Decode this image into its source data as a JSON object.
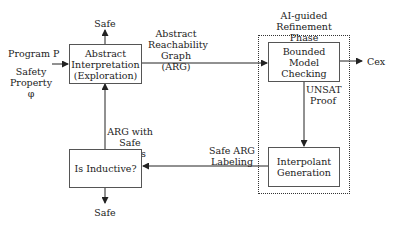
{
  "diagram": {
    "inputs": {
      "program": "Program P",
      "property": "Safety\nProperty φ"
    },
    "nodes": {
      "abstract_interpretation": "Abstract\nInterpretation\n(Exploration)",
      "bounded_model_checking": "Bounded\nModel\nChecking",
      "interpolant_generation": "Interpolant\nGeneration",
      "is_inductive": "Is Inductive?"
    },
    "group": {
      "label": "AI-guided\nRefinement Phase"
    },
    "edge_labels": {
      "arg": "Abstract\nReachability\nGraph (ARG)",
      "unsat_proof": "UNSAT\nProof",
      "safe_arg_labeling": "Safe ARG\nLabeling",
      "arg_safe_labels": "ARG with\nSafe Labels"
    },
    "outputs": {
      "safe_top": "Safe",
      "safe_bottom": "Safe",
      "cex": "Cex"
    }
  }
}
